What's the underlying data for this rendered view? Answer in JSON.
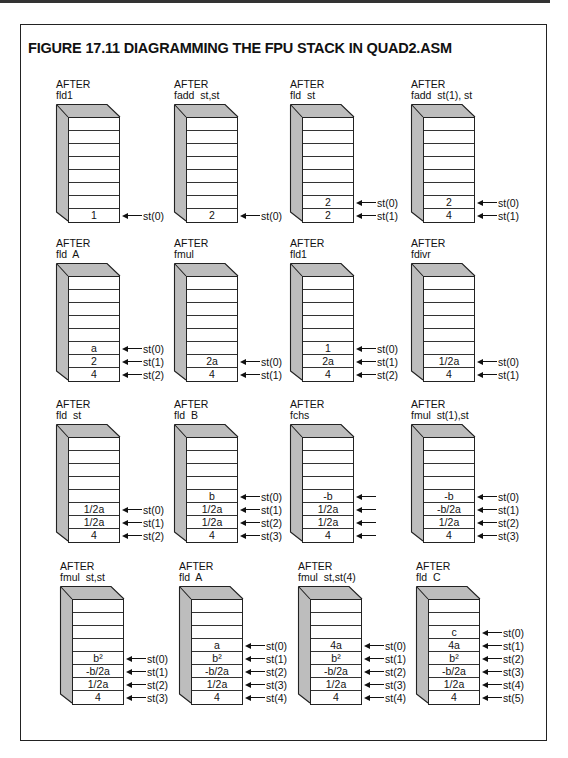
{
  "figure": {
    "title": "FIGURE 17.11  DIAGRAMMING THE FPU STACK IN QUAD2.ASM"
  },
  "stack_size": 8,
  "panels": [
    {
      "caption": "AFTER",
      "instruction": "fld1",
      "x": 56,
      "y": 79,
      "values": [
        "1"
      ],
      "pointers": [
        "st(0)"
      ]
    },
    {
      "caption": "AFTER",
      "instruction": "fadd  st,st",
      "x": 174,
      "y": 79,
      "values": [
        "2"
      ],
      "pointers": [
        "st(0)"
      ]
    },
    {
      "caption": "AFTER",
      "instruction": "fld  st",
      "x": 290,
      "y": 79,
      "values": [
        "2",
        "2"
      ],
      "pointers": [
        "st(0)",
        "st(1)"
      ]
    },
    {
      "caption": "AFTER",
      "instruction": "fadd  st(1), st",
      "x": 411,
      "y": 79,
      "values": [
        "2",
        "4"
      ],
      "pointers": [
        "st(0)",
        "st(1)"
      ]
    },
    {
      "caption": "AFTER",
      "instruction": "fld  A",
      "x": 56,
      "y": 238,
      "values": [
        "a",
        "2",
        "4"
      ],
      "pointers": [
        "st(0)",
        "st(1)",
        "st(2)"
      ]
    },
    {
      "caption": "AFTER",
      "instruction": "fmul",
      "x": 174,
      "y": 238,
      "values": [
        "2a",
        "4"
      ],
      "pointers": [
        "st(0)",
        "st(1)"
      ]
    },
    {
      "caption": "AFTER",
      "instruction": "fld1",
      "x": 290,
      "y": 238,
      "values": [
        "1",
        "2a",
        "4"
      ],
      "pointers": [
        "st(0)",
        "st(1)",
        "st(2)"
      ]
    },
    {
      "caption": "AFTER",
      "instruction": "fdivr",
      "x": 411,
      "y": 238,
      "values": [
        "1/2a",
        "4"
      ],
      "pointers": [
        "st(0)",
        "st(1)"
      ]
    },
    {
      "caption": "AFTER",
      "instruction": "fld  st",
      "x": 56,
      "y": 399,
      "values": [
        "1/2a",
        "1/2a",
        "4"
      ],
      "pointers": [
        "st(0)",
        "st(1)",
        "st(2)"
      ]
    },
    {
      "caption": "AFTER",
      "instruction": "fld  B",
      "x": 174,
      "y": 399,
      "values": [
        "b",
        "1/2a",
        "1/2a",
        "4"
      ],
      "pointers": [
        "st(0)",
        "st(1)",
        "st(2)",
        "st(3)"
      ]
    },
    {
      "caption": "AFTER",
      "instruction": "fchs",
      "x": 290,
      "y": 399,
      "values": [
        "-b",
        "1/2a",
        "1/2a",
        "4"
      ],
      "pointers": [
        "",
        "",
        "",
        ""
      ]
    },
    {
      "caption": "AFTER",
      "instruction": "fmul  st(1),st",
      "x": 411,
      "y": 399,
      "values": [
        "-b",
        "-b/2a",
        "1/2a",
        "4"
      ],
      "pointers": [
        "st(0)",
        "st(1)",
        "st(2)",
        "st(3)"
      ]
    },
    {
      "caption": "AFTER",
      "instruction": "fmul  st,st",
      "x": 60,
      "y": 561,
      "values": [
        "b²",
        "-b/2a",
        "1/2a",
        "4"
      ],
      "pointers": [
        "st(0)",
        "st(1)",
        "st(2)",
        "st(3)"
      ]
    },
    {
      "caption": "AFTER",
      "instruction": "fld  A",
      "x": 179,
      "y": 561,
      "values": [
        "a",
        "b²",
        "-b/2a",
        "1/2a",
        "4"
      ],
      "pointers": [
        "st(0)",
        "st(1)",
        "st(2)",
        "st(3)",
        "st(4)"
      ]
    },
    {
      "caption": "AFTER",
      "instruction": "fmul  st,st(4)",
      "x": 298,
      "y": 561,
      "values": [
        "4a",
        "b²",
        "-b/2a",
        "1/2a",
        "4"
      ],
      "pointers": [
        "st(0)",
        "st(1)",
        "st(2)",
        "st(3)",
        "st(4)"
      ]
    },
    {
      "caption": "AFTER",
      "instruction": "fld  C",
      "x": 416,
      "y": 561,
      "values": [
        "c",
        "4a",
        "b²",
        "-b/2a",
        "1/2a",
        "4"
      ],
      "pointers": [
        "st(0)",
        "st(1)",
        "st(2)",
        "st(3)",
        "st(4)",
        "st(5)"
      ]
    }
  ]
}
